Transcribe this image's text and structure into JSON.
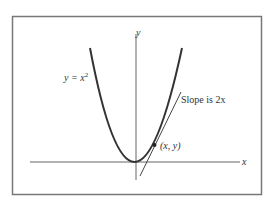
{
  "figure": {
    "curve_label": "y = x",
    "curve_exp": "2",
    "y_axis_label": "y",
    "x_axis_label": "x",
    "slope_label": "Slope is 2x",
    "point_label": "(x, y)"
  },
  "colors": {
    "curve": "#333333",
    "frame": "#777777",
    "axis": "#666666"
  }
}
